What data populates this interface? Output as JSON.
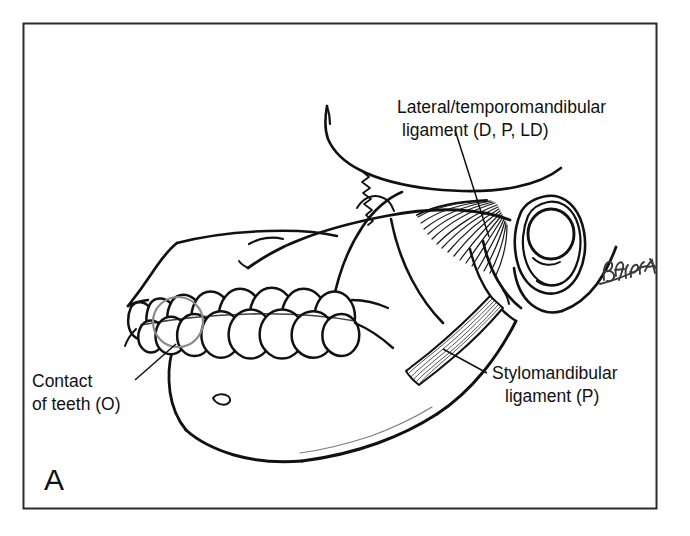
{
  "figure": {
    "panel_letter": "A",
    "panel_letter_position": "bottom-left",
    "border_color": "#2b2b2b",
    "background_color": "#ffffff",
    "ink_color": "#111111",
    "highlight_circle_color": "#8a8a8a",
    "artist_signature": "Batista"
  },
  "labels": {
    "lateral_ligament": {
      "line1": "Lateral/temporomandibular",
      "line2": "ligament (D, P, LD)",
      "x": 397,
      "y": 113,
      "leader_from_x": 455,
      "leader_from_y": 130,
      "leader_to_x": 489,
      "leader_to_y": 237
    },
    "contact_of_teeth": {
      "line1": "Contact",
      "line2": "of teeth (O)",
      "x": 32,
      "y": 387,
      "leader_from_x": 135,
      "leader_from_y": 380,
      "leader_to_x": 176,
      "leader_to_y": 344
    },
    "stylomandibular": {
      "line1": "Stylomandibular",
      "line2": "ligament (P)",
      "x": 492,
      "y": 379,
      "leader_from_x": 487,
      "leader_from_y": 373,
      "leader_to_x": 443,
      "leader_to_y": 349
    }
  },
  "highlight_circle": {
    "cx": 178,
    "cy": 322,
    "r": 25
  },
  "border": {
    "x": 23,
    "y": 23,
    "width": 633,
    "height": 485
  }
}
